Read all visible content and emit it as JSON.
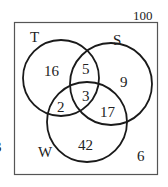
{
  "diagram": {
    "type": "venn-3-set",
    "universal_total": "100",
    "sets": [
      {
        "name": "T"
      },
      {
        "name": "S"
      },
      {
        "name": "W"
      }
    ],
    "regions": {
      "T_only": "16",
      "S_only": "9",
      "W_only": "42",
      "T_and_S_only": "5",
      "T_and_W_only": "2",
      "S_and_W_only": "17",
      "T_S_W": "3",
      "outside": "6"
    },
    "edge_fragment": "3"
  }
}
